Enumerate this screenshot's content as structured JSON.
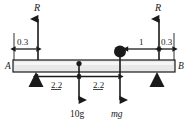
{
  "diagram": {
    "colors": {
      "line": "#1a1a1a",
      "beam_fill": "#e8e8e8",
      "background": "#ffffff"
    },
    "beam": {
      "left_label": "A",
      "right_label": "B"
    },
    "forces": [
      {
        "name": "reaction-left",
        "label": "R",
        "direction": "up",
        "x": 38
      },
      {
        "name": "reaction-right",
        "label": "R",
        "direction": "up",
        "x": 159
      },
      {
        "name": "load-10g",
        "label": "10g",
        "direction": "down",
        "x": 79
      },
      {
        "name": "load-mg",
        "label": "mg",
        "direction": "down",
        "x": 120
      }
    ],
    "dimensions": [
      {
        "name": "dim-left-overhang",
        "label": "0.3"
      },
      {
        "name": "dim-circle-to-r",
        "label": "1"
      },
      {
        "name": "dim-right-overhang",
        "label": "0.3"
      },
      {
        "name": "dim-support-to-dot",
        "label": "2.2"
      },
      {
        "name": "dim-dot-to-circle",
        "label": "2.2"
      }
    ],
    "supports": [
      {
        "name": "support-left",
        "x": 36
      },
      {
        "name": "support-right",
        "x": 157
      }
    ],
    "masses": [
      {
        "name": "point-mass-small",
        "x": 79,
        "r": 2.6
      },
      {
        "name": "point-mass-large",
        "x": 120,
        "r": 6.0
      }
    ]
  }
}
